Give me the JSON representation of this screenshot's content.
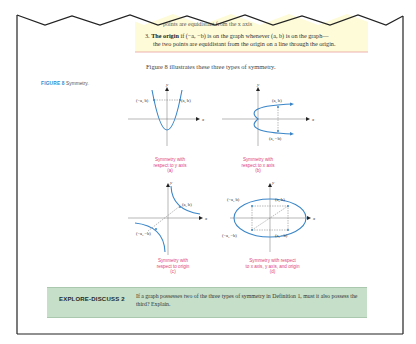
{
  "header_fragment": {
    "cut_line_text": "points are equidistant from the x axis"
  },
  "definition_box": {
    "item_number": "3.",
    "term": "The origin",
    "text_line1": "if (−a, −b) is on the graph whenever (a, b) is on the graph—",
    "text_line2": "the two points are equidistant from the origin on a line through the origin.",
    "background_color": "#fdfbd8",
    "border_color": "#e8a0a0"
  },
  "intro_sentence": "Figure 8 illustrates these three types of symmetry.",
  "figure": {
    "number_label": "FIGURE 8",
    "caption_title": "Symmetry.",
    "label_color": "#2d8bd0",
    "caption_color": "#e0427a",
    "curve_color": "#3a86c8",
    "panels": [
      {
        "id": "a",
        "x_axis": "x",
        "y_axis": "y",
        "point_left": "(−a, b)",
        "point_right": "(a, b)",
        "caption_line1": "Symmetry with",
        "caption_line2": "respect to y axis",
        "caption_line3": "(a)"
      },
      {
        "id": "b",
        "x_axis": "x",
        "y_axis": "y",
        "point_top": "(a, b)",
        "point_bottom": "(a, −b)",
        "caption_line1": "Symmetry with",
        "caption_line2": "respect to x axis",
        "caption_line3": "(b)"
      },
      {
        "id": "c",
        "x_axis": "x",
        "y_axis": "y",
        "point_right": "(a, b)",
        "point_left": "(−a, −b)",
        "caption_line1": "Symmetry with",
        "caption_line2": "respect to origin",
        "caption_line3": "(c)"
      },
      {
        "id": "d",
        "x_axis": "x",
        "y_axis": "y",
        "point_tl": "(−a, b)",
        "point_tr": "(a, b)",
        "point_bl": "(−a, −b)",
        "point_br": "(a, −b)",
        "caption_line1": "Symmetry with respect",
        "caption_line2": "to x axis, y axis, and origin",
        "caption_line3": "(d)"
      }
    ]
  },
  "explore_discuss": {
    "title": "EXPLORE-DISCUSS 2",
    "text": "If a graph possesses two of the three types of symmetry in Definition 1, must it also possess the third? Explain.",
    "background_color": "#c5dfc9"
  }
}
